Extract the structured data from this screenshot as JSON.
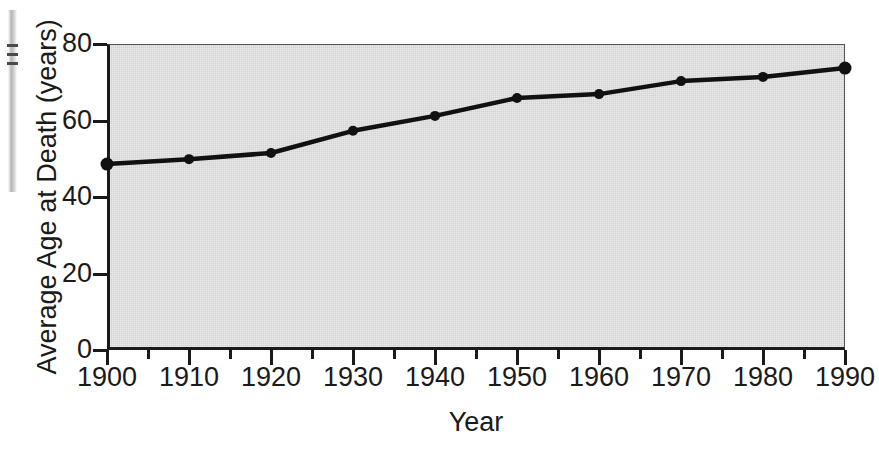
{
  "chart_data": {
    "type": "line",
    "title": "",
    "xlabel": "Year",
    "ylabel": "Average Age at Death (years)",
    "x": [
      1900,
      1910,
      1920,
      1930,
      1940,
      1950,
      1960,
      1970,
      1980,
      1990
    ],
    "values": [
      48.6,
      49.9,
      51.5,
      57.3,
      61.2,
      65.9,
      66.9,
      70.3,
      71.4,
      73.7
    ],
    "series": [
      {
        "name": "Average Age at Death",
        "values": [
          48.6,
          49.9,
          51.5,
          57.3,
          61.2,
          65.9,
          66.9,
          70.3,
          71.4,
          73.7
        ]
      }
    ],
    "xlim": [
      1900,
      1990
    ],
    "ylim": [
      0,
      80
    ],
    "ytick_values": [
      0,
      20,
      40,
      60,
      80
    ],
    "ytick_labels": [
      "0",
      "20",
      "40",
      "60",
      "80"
    ],
    "xtick_values": [
      1900,
      1910,
      1920,
      1930,
      1940,
      1950,
      1960,
      1970,
      1980,
      1990
    ],
    "xtick_labels": [
      "1900",
      "1910",
      "1920",
      "1930",
      "1940",
      "1950",
      "1960",
      "1970",
      "1980",
      "1990"
    ],
    "xtick_minor_values": [
      1905,
      1915,
      1925,
      1935,
      1945,
      1955,
      1965,
      1975,
      1985
    ],
    "grid": false,
    "legend": false,
    "legend_position": "none",
    "marker": "filled-circle",
    "line_color": "#111111",
    "marker_color": "#111111",
    "plot_background_color": "#d2d2d2",
    "page_background_color": "#ffffff",
    "axis_color": "#1a1a1a"
  },
  "axis": {
    "y_title": "Average Age at Death (years)",
    "x_title": "Year"
  }
}
